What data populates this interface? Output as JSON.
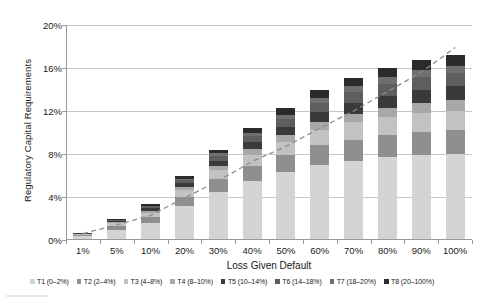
{
  "chart_data": {
    "type": "bar",
    "stacked": true,
    "title": "",
    "xlabel": "Loss Given Default",
    "ylabel": "Regulatory Capital Requirements",
    "categories": [
      "1%",
      "5%",
      "10%",
      "20%",
      "30%",
      "40%",
      "50%",
      "60%",
      "70%",
      "80%",
      "90%",
      "100%"
    ],
    "ylim": [
      0,
      20
    ],
    "ytick_labels": [
      "0%",
      "4%",
      "8%",
      "12%",
      "16%",
      "20%"
    ],
    "ytick_values": [
      0,
      4,
      8,
      12,
      16,
      20
    ],
    "grid": true,
    "legend_position": "bottom",
    "series": [
      {
        "name": "T1 (0–2%)",
        "color": "#d4d4d4",
        "values": [
          0.25,
          0.85,
          1.5,
          3.1,
          4.4,
          5.4,
          6.2,
          6.9,
          7.3,
          7.6,
          7.8,
          7.9
        ]
      },
      {
        "name": "T2 (2–4%)",
        "color": "#8f8f8f",
        "values": [
          0.1,
          0.35,
          0.55,
          0.85,
          1.15,
          1.4,
          1.6,
          1.8,
          1.95,
          2.05,
          2.15,
          2.2
        ]
      },
      {
        "name": "T3 (4–8%)",
        "color": "#c2c2c2",
        "values": [
          0.08,
          0.25,
          0.4,
          0.6,
          0.85,
          1.05,
          1.25,
          1.45,
          1.6,
          1.7,
          1.8,
          1.85
        ]
      },
      {
        "name": "T4 (8–10%)",
        "color": "#a8a8a8",
        "values": [
          0.04,
          0.1,
          0.18,
          0.28,
          0.4,
          0.5,
          0.6,
          0.7,
          0.78,
          0.85,
          0.9,
          0.95
        ]
      },
      {
        "name": "T5 (10–14%)",
        "color": "#3a3a3a",
        "values": [
          0.05,
          0.12,
          0.22,
          0.35,
          0.5,
          0.65,
          0.8,
          0.95,
          1.05,
          1.15,
          1.25,
          1.3
        ]
      },
      {
        "name": "T6 (14–18%)",
        "color": "#5e5e5e",
        "values": [
          0.04,
          0.1,
          0.18,
          0.3,
          0.45,
          0.6,
          0.75,
          0.9,
          1.0,
          1.1,
          1.2,
          1.25
        ]
      },
      {
        "name": "T7 (18–20%)",
        "color": "#6f6f6f",
        "values": [
          0.02,
          0.05,
          0.09,
          0.15,
          0.22,
          0.3,
          0.38,
          0.45,
          0.52,
          0.58,
          0.62,
          0.65
        ]
      },
      {
        "name": "T8 (20–100%)",
        "color": "#2b2b2b",
        "values": [
          0.02,
          0.08,
          0.13,
          0.22,
          0.33,
          0.45,
          0.57,
          0.68,
          0.78,
          0.87,
          0.93,
          1.0
        ]
      }
    ],
    "trend_line": {
      "name": "trend",
      "style": "dashed",
      "color": "#8c8c8c",
      "values": [
        0.6,
        1.4,
        2.3,
        3.9,
        5.5,
        7.3,
        8.7,
        10.4,
        12.0,
        13.8,
        15.6,
        17.9
      ]
    }
  },
  "legend": {
    "items": [
      {
        "label": "T1 (0–2%)",
        "color": "#d4d4d4"
      },
      {
        "label": "T2 (2–4%)",
        "color": "#8f8f8f"
      },
      {
        "label": "T3 (4–8%)",
        "color": "#c2c2c2"
      },
      {
        "label": "T4 (8–10%)",
        "color": "#a8a8a8"
      },
      {
        "label": "T5 (10–14%)",
        "color": "#3a3a3a"
      },
      {
        "label": "T6 (14–18%)",
        "color": "#5e5e5e"
      },
      {
        "label": "T7 (18–20%)",
        "color": "#6f6f6f"
      },
      {
        "label": "T8 (20–100%)",
        "color": "#2b2b2b"
      }
    ]
  },
  "axis": {
    "x_title": "Loss Given Default",
    "y_title": "Regulatory Capital Requirements"
  },
  "colors": {
    "gridline": "#c6c6c6",
    "axis": "#9a9a9a",
    "text": "#1a1a1a",
    "trend": "#8c8c8c"
  }
}
